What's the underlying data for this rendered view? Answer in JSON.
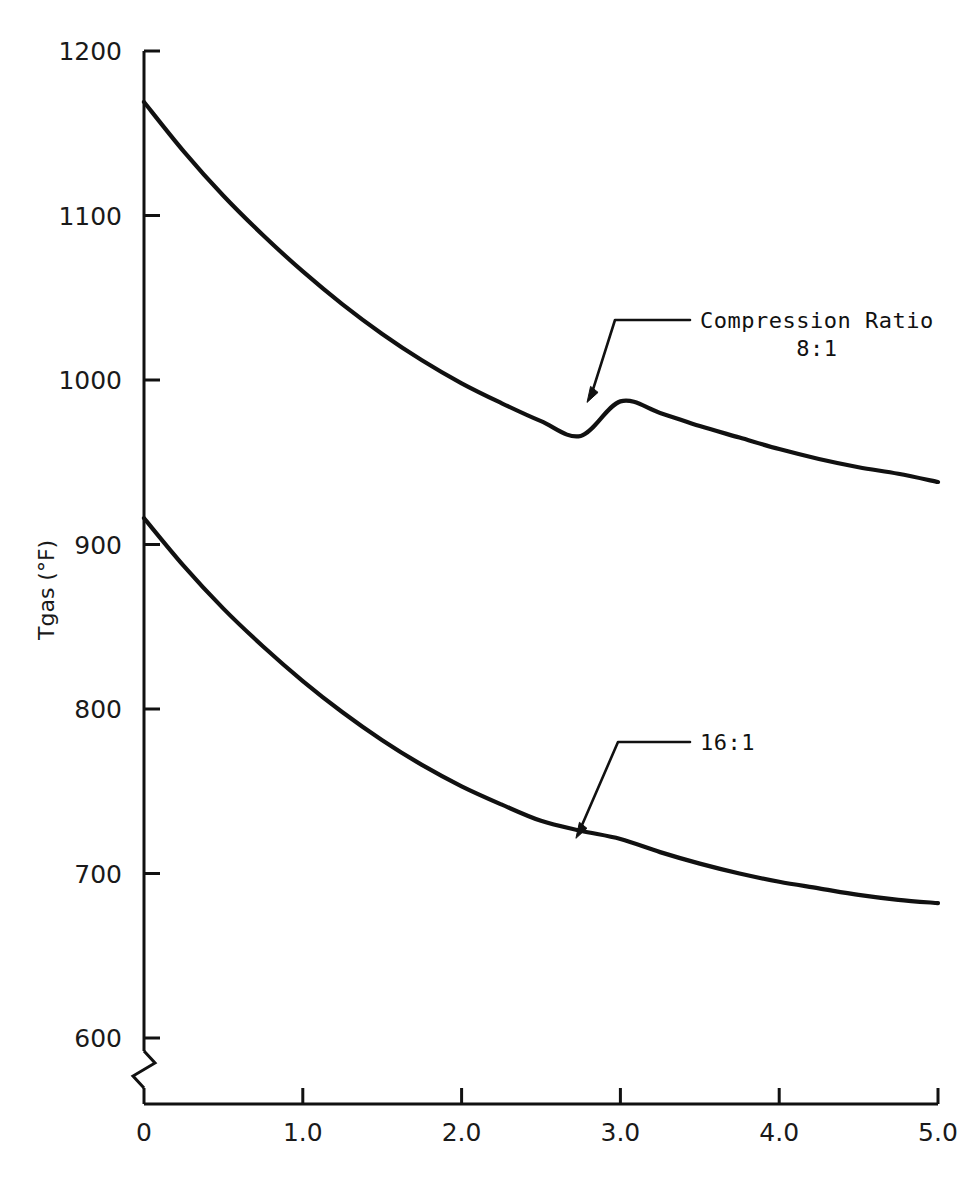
{
  "chart_data": {
    "type": "line",
    "title": "",
    "xlabel": "",
    "ylabel": "Tgas (°F)",
    "xlim": [
      0,
      5.0
    ],
    "ylim": [
      560,
      1200
    ],
    "grid": false,
    "legend_position": "inline-annotations",
    "y_axis_break": true,
    "y_axis_break_note": "zigzag break between the 600 tick and the x-axis baseline",
    "xticks": [
      0,
      1.0,
      2.0,
      3.0,
      4.0,
      5.0
    ],
    "xtick_labels": [
      "0",
      "1.0",
      "2.0",
      "3.0",
      "4.0",
      "5.0"
    ],
    "yticks": [
      600,
      700,
      800,
      900,
      1000,
      1100,
      1200
    ],
    "ytick_labels": [
      "600",
      "700",
      "800",
      "900",
      "1000",
      "1100",
      "1200"
    ],
    "series": [
      {
        "name": "Compression Ratio 8:1",
        "annotation_label": "Compression Ratio\n8:1",
        "color": "#111111",
        "x": [
          0.0,
          0.25,
          0.5,
          0.75,
          1.0,
          1.25,
          1.5,
          1.75,
          2.0,
          2.25,
          2.5,
          2.75,
          3.0,
          3.25,
          3.5,
          3.75,
          4.0,
          4.25,
          4.5,
          4.75,
          5.0
        ],
        "values": [
          1169,
          1139,
          1112,
          1088,
          1066,
          1046,
          1028,
          1012,
          998,
          986,
          975,
          966,
          987,
          980,
          972,
          965,
          958,
          952,
          947,
          943,
          938
        ]
      },
      {
        "name": "Compression Ratio 16:1",
        "annotation_label": "16:1",
        "color": "#111111",
        "x": [
          0.0,
          0.25,
          0.5,
          0.75,
          1.0,
          1.25,
          1.5,
          1.75,
          2.0,
          2.25,
          2.5,
          2.75,
          3.0,
          3.25,
          3.5,
          3.75,
          4.0,
          4.25,
          4.5,
          4.75,
          5.0
        ],
        "values": [
          916,
          887,
          861,
          838,
          817,
          798,
          781,
          766,
          753,
          742,
          732,
          726,
          721,
          713,
          706,
          700,
          695,
          691,
          687,
          684,
          682
        ]
      }
    ],
    "annotations": [
      {
        "text": "Compression Ratio\n8:1",
        "points_to_x": 2.79,
        "points_to_y": 987
      },
      {
        "text": "16:1",
        "points_to_x": 2.72,
        "points_to_y": 722
      }
    ]
  },
  "axis": {
    "y_title": "Tgas (°F)",
    "x_title": ""
  },
  "colors": {
    "background": "#ffffff",
    "ink": "#111111",
    "axis": "#1a1a1a"
  }
}
